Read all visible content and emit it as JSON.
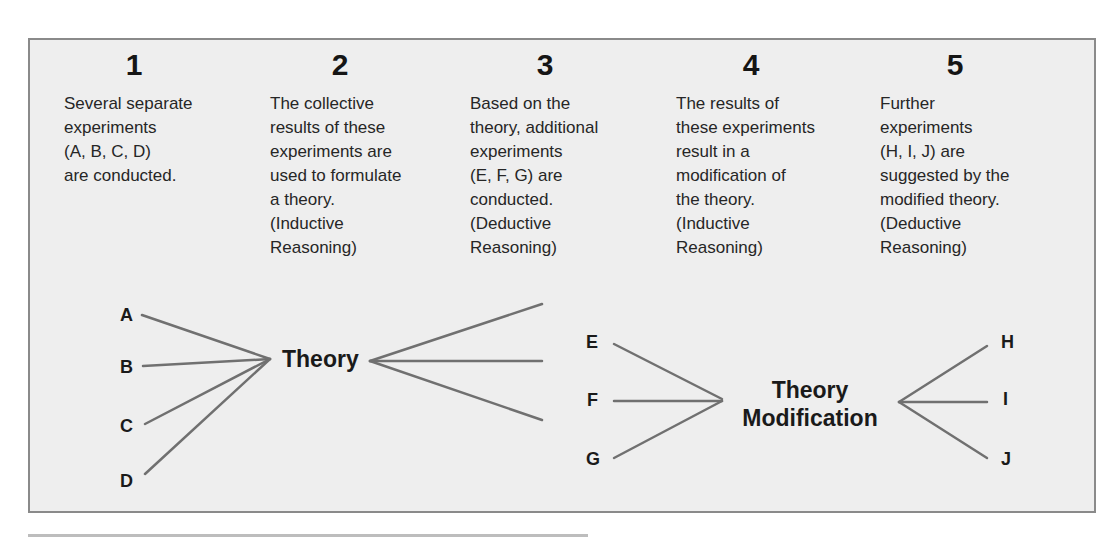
{
  "steps": [
    {
      "number": "1",
      "text": "Several separate\nexperiments\n(A, B, C, D)\nare conducted."
    },
    {
      "number": "2",
      "text": "The collective\nresults of these\nexperiments are\nused to formulate\na theory.\n(Inductive\nReasoning)"
    },
    {
      "number": "3",
      "text": "Based on the\ntheory, additional\nexperiments\n(E, F, G) are\nconducted.\n(Deductive\nReasoning)"
    },
    {
      "number": "4",
      "text": "The results of\nthese experiments\nresult in a\nmodification of\nthe theory.\n(Inductive\nReasoning)"
    },
    {
      "number": "5",
      "text": "Further\nexperiments\n(H, I, J) are\nsuggested by the\nmodified theory.\n(Deductive\nReasoning)"
    }
  ],
  "nodes": {
    "experiments_initial": [
      "A",
      "B",
      "C",
      "D"
    ],
    "theory": "Theory",
    "experiments_deductive": [
      "E",
      "F",
      "G"
    ],
    "theory_modification_line1": "Theory",
    "theory_modification_line2": "Modification",
    "experiments_further": [
      "H",
      "I",
      "J"
    ]
  },
  "colors": {
    "panel_background": "#eeeeee",
    "panel_border": "#8a8a8a",
    "connector_lines": "#707070",
    "text": "#1a1a1a"
  }
}
